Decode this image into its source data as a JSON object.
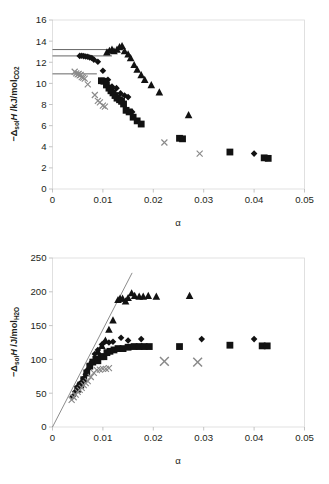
{
  "figure": {
    "name": "enthalpy-of-solution-vs-alpha",
    "background": "#ffffff",
    "caption_fragment": ""
  },
  "chart_data": [
    {
      "id": "top",
      "type": "scatter",
      "title": "",
      "xlabel": "α",
      "ylabel_parts": {
        "minus": "−",
        "delta": "Δ",
        "delta_sub": "sol",
        "h": "H",
        "units": " /kJ/mol",
        "units_sub": "CO2"
      },
      "ylabel": "−ΔsolH /kJ/molCO2",
      "xlim": [
        0,
        0.05
      ],
      "ylim": [
        0,
        16
      ],
      "xticks": [
        0,
        0.01,
        0.02,
        0.03,
        0.04,
        0.05
      ],
      "xticklabels": [
        "0",
        "0.01",
        "0.02",
        "0.03",
        "0.04",
        "0.05"
      ],
      "yticks": [
        0,
        2,
        4,
        6,
        8,
        10,
        12,
        14,
        16
      ],
      "yticklabels": [
        "0",
        "2",
        "4",
        "6",
        "8",
        "10",
        "12",
        "14",
        "16"
      ],
      "grid": false,
      "legend": "none",
      "reference_lines": [
        {
          "name": "ref-line-13.2",
          "y": 13.2,
          "x_start": 0.0,
          "x_end": 0.0118
        },
        {
          "name": "ref-line-12.6",
          "y": 12.6,
          "x_start": 0.0,
          "x_end": 0.0118
        },
        {
          "name": "ref-line-10.9",
          "y": 10.9,
          "x_start": 0.0,
          "x_end": 0.0088
        }
      ],
      "series": [
        {
          "name": "triangles",
          "marker": "triangle",
          "color": "#121212",
          "points": [
            [
              0.0108,
              12.95
            ],
            [
              0.0113,
              13.1
            ],
            [
              0.0118,
              13.2
            ],
            [
              0.0122,
              13.05
            ],
            [
              0.0128,
              13.2
            ],
            [
              0.0133,
              13.45
            ],
            [
              0.0138,
              13.55
            ],
            [
              0.0143,
              13.05
            ],
            [
              0.015,
              12.75
            ],
            [
              0.0155,
              12.4
            ],
            [
              0.0162,
              11.75
            ],
            [
              0.0168,
              11.3
            ],
            [
              0.0176,
              10.8
            ],
            [
              0.0183,
              10.35
            ],
            [
              0.0196,
              9.85
            ],
            [
              0.0212,
              9.15
            ],
            [
              0.027,
              7.0
            ]
          ]
        },
        {
          "name": "diamonds",
          "marker": "diamond",
          "color": "#121212",
          "points": [
            [
              0.0054,
              12.6
            ],
            [
              0.0058,
              12.62
            ],
            [
              0.0062,
              12.58
            ],
            [
              0.0066,
              12.55
            ],
            [
              0.007,
              12.52
            ],
            [
              0.0074,
              12.45
            ],
            [
              0.0078,
              12.4
            ],
            [
              0.0082,
              12.25
            ],
            [
              0.009,
              12.05
            ],
            [
              0.01,
              11.2
            ],
            [
              0.011,
              10.35
            ],
            [
              0.0118,
              9.7
            ],
            [
              0.0127,
              9.55
            ],
            [
              0.0135,
              9.05
            ],
            [
              0.0143,
              8.85
            ],
            [
              0.015,
              8.7
            ],
            [
              0.0158,
              7.3
            ],
            [
              0.04,
              3.35
            ]
          ]
        },
        {
          "name": "squares",
          "marker": "square",
          "color": "#121212",
          "points": [
            [
              0.0097,
              10.25
            ],
            [
              0.0102,
              10.2
            ],
            [
              0.0107,
              9.85
            ],
            [
              0.0112,
              9.55
            ],
            [
              0.0116,
              9.3
            ],
            [
              0.012,
              9.1
            ],
            [
              0.0124,
              8.85
            ],
            [
              0.0128,
              8.6
            ],
            [
              0.0133,
              8.45
            ],
            [
              0.0137,
              8.3
            ],
            [
              0.0141,
              8.05
            ],
            [
              0.0146,
              7.45
            ],
            [
              0.0152,
              7.3
            ],
            [
              0.016,
              6.8
            ],
            [
              0.0168,
              6.45
            ],
            [
              0.0176,
              6.15
            ],
            [
              0.0252,
              4.8
            ],
            [
              0.0258,
              4.75
            ],
            [
              0.0352,
              3.5
            ],
            [
              0.042,
              2.95
            ],
            [
              0.0428,
              2.9
            ]
          ]
        },
        {
          "name": "crosses",
          "marker": "x",
          "color": "#8a8a8a",
          "points": [
            [
              0.0044,
              11.1
            ],
            [
              0.0047,
              10.95
            ],
            [
              0.005,
              10.85
            ],
            [
              0.0052,
              10.9
            ],
            [
              0.0054,
              10.75
            ],
            [
              0.0056,
              10.8
            ],
            [
              0.0058,
              10.6
            ],
            [
              0.0061,
              10.55
            ],
            [
              0.0064,
              10.45
            ],
            [
              0.007,
              9.9
            ],
            [
              0.0084,
              8.9
            ],
            [
              0.009,
              8.35
            ],
            [
              0.0094,
              8.2
            ],
            [
              0.01,
              7.9
            ],
            [
              0.0104,
              7.8
            ],
            [
              0.0222,
              4.4
            ],
            [
              0.0292,
              3.35
            ]
          ]
        }
      ]
    },
    {
      "id": "bottom",
      "type": "scatter",
      "title": "",
      "xlabel": "α",
      "ylabel_parts": {
        "minus": "−",
        "delta": "Δ",
        "delta_sub": "sol",
        "h": "H",
        "units": " /J/mol",
        "units_sub": "H2O"
      },
      "ylabel": "−ΔsolH /J/molH2O",
      "xlim": [
        0,
        0.05
      ],
      "ylim": [
        0,
        250
      ],
      "xticks": [
        0,
        0.01,
        0.02,
        0.03,
        0.04,
        0.05
      ],
      "xticklabels": [
        "0",
        "0.01",
        "0.02",
        "0.03",
        "0.04",
        "0.05"
      ],
      "yticks": [
        0,
        50,
        100,
        150,
        200,
        250
      ],
      "yticklabels": [
        "0",
        "50",
        "100",
        "150",
        "200",
        "250"
      ],
      "grid": false,
      "legend": "none",
      "fit_lines": [
        {
          "name": "origin-fit-line",
          "x_start": 0.0,
          "y_start": 0.0,
          "x_end": 0.0158,
          "y_end": 228.0
        }
      ],
      "series": [
        {
          "name": "triangles",
          "marker": "triangle",
          "color": "#121212",
          "points": [
            [
              0.009,
              112
            ],
            [
              0.0098,
              120
            ],
            [
              0.0105,
              128
            ],
            [
              0.0112,
              144
            ],
            [
              0.012,
              158
            ],
            [
              0.013,
              188
            ],
            [
              0.0134,
              190
            ],
            [
              0.0139,
              190
            ],
            [
              0.0145,
              186
            ],
            [
              0.015,
              191
            ],
            [
              0.0157,
              198
            ],
            [
              0.0163,
              194
            ],
            [
              0.0172,
              193
            ],
            [
              0.018,
              193
            ],
            [
              0.019,
              194
            ],
            [
              0.0206,
              193
            ],
            [
              0.0272,
              194
            ]
          ]
        },
        {
          "name": "diamonds",
          "marker": "diamond",
          "color": "#121212",
          "points": [
            [
              0.004,
              45
            ],
            [
              0.0045,
              52
            ],
            [
              0.005,
              60
            ],
            [
              0.0054,
              64
            ],
            [
              0.0058,
              66
            ],
            [
              0.0062,
              72
            ],
            [
              0.0066,
              78
            ],
            [
              0.007,
              85
            ],
            [
              0.0074,
              92
            ],
            [
              0.0078,
              96
            ],
            [
              0.0084,
              108
            ],
            [
              0.009,
              114
            ],
            [
              0.0098,
              122
            ],
            [
              0.0104,
              126
            ],
            [
              0.0112,
              125
            ],
            [
              0.012,
              126
            ],
            [
              0.0136,
              132
            ],
            [
              0.015,
              128
            ],
            [
              0.0176,
              130
            ],
            [
              0.0296,
              130
            ],
            [
              0.04,
              130
            ]
          ]
        },
        {
          "name": "squares",
          "marker": "square",
          "color": "#121212",
          "points": [
            [
              0.005,
              56
            ],
            [
              0.0056,
              62
            ],
            [
              0.0062,
              70
            ],
            [
              0.0068,
              80
            ],
            [
              0.0074,
              90
            ],
            [
              0.008,
              96
            ],
            [
              0.0086,
              100
            ],
            [
              0.009,
              98
            ],
            [
              0.0096,
              104
            ],
            [
              0.0102,
              104
            ],
            [
              0.0108,
              110
            ],
            [
              0.0114,
              112
            ],
            [
              0.0122,
              114
            ],
            [
              0.013,
              116
            ],
            [
              0.014,
              116
            ],
            [
              0.015,
              118
            ],
            [
              0.0162,
              119
            ],
            [
              0.0172,
              119
            ],
            [
              0.0182,
              119
            ],
            [
              0.0192,
              119
            ],
            [
              0.0252,
              119
            ],
            [
              0.0352,
              121
            ],
            [
              0.0416,
              120
            ],
            [
              0.0426,
              120
            ]
          ]
        },
        {
          "name": "crosses",
          "marker": "x",
          "color": "#8a8a8a",
          "points": [
            [
              0.0038,
              40
            ],
            [
              0.0042,
              44
            ],
            [
              0.0046,
              48
            ],
            [
              0.005,
              52
            ],
            [
              0.0054,
              55
            ],
            [
              0.0058,
              58
            ],
            [
              0.0062,
              62
            ],
            [
              0.0066,
              65
            ],
            [
              0.007,
              68
            ],
            [
              0.0076,
              74
            ],
            [
              0.0082,
              80
            ],
            [
              0.0088,
              84
            ],
            [
              0.0094,
              85
            ],
            [
              0.01,
              86
            ],
            [
              0.0106,
              86
            ],
            [
              0.0112,
              87
            ]
          ]
        },
        {
          "name": "crosses-large",
          "marker": "x-big",
          "color": "#8a8a8a",
          "points": [
            [
              0.0222,
              97
            ],
            [
              0.0288,
              96
            ]
          ]
        }
      ]
    }
  ]
}
